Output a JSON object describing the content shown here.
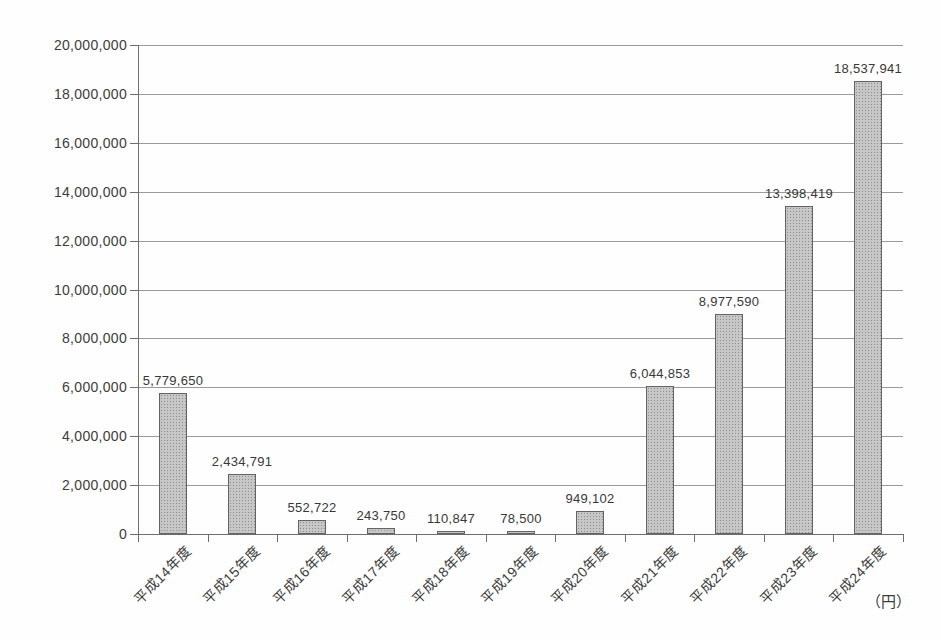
{
  "chart_data": {
    "type": "bar",
    "title": "",
    "xlabel": "",
    "ylabel": "",
    "unit_label": "（円）",
    "categories": [
      "平成14年度",
      "平成15年度",
      "平成16年度",
      "平成17年度",
      "平成18年度",
      "平成19年度",
      "平成20年度",
      "平成21年度",
      "平成22年度",
      "平成23年度",
      "平成24年度"
    ],
    "values": [
      5779650,
      2434791,
      552722,
      243750,
      110847,
      78500,
      949102,
      6044853,
      8977590,
      13398419,
      18537941
    ],
    "value_labels": [
      "5,779,650",
      "2,434,791",
      "552,722",
      "243,750",
      "110,847",
      "78,500",
      "949,102",
      "6,044,853",
      "8,977,590",
      "13,398,419",
      "18,537,941"
    ],
    "ylim": [
      0,
      20000000
    ],
    "ytick_step": 2000000,
    "ytick_labels": [
      "0",
      "2,000,000",
      "4,000,000",
      "6,000,000",
      "8,000,000",
      "10,000,000",
      "12,000,000",
      "14,000,000",
      "16,000,000",
      "18,000,000",
      "20,000,000"
    ],
    "grid": true,
    "legend_position": "none",
    "colors": {
      "bar_fill": "#c7c7c7",
      "bar_dots": "#8c8c8c",
      "bar_border": "#636363",
      "gridline": "#9a9a9a",
      "axis": "#6e6e6e",
      "text": "#3c3c3c",
      "background": "#fefefe"
    }
  }
}
